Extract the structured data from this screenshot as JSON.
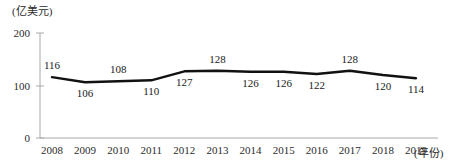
{
  "chart_data": {
    "type": "line",
    "title": "",
    "unit_label": "(亿美元)",
    "xlabel": "(年份)",
    "ylabel": "",
    "categories": [
      "2008",
      "2009",
      "2010",
      "2011",
      "2012",
      "2013",
      "2014",
      "2015",
      "2016",
      "2017",
      "2018",
      "2019"
    ],
    "values": [
      116,
      106,
      108,
      110,
      127,
      128,
      126,
      126,
      122,
      128,
      120,
      114
    ],
    "label_positions": [
      "above",
      "below",
      "above",
      "below",
      "below",
      "above",
      "below",
      "below",
      "below",
      "above",
      "below",
      "below"
    ],
    "ylim": [
      0,
      200
    ],
    "yticks": [
      0,
      100,
      200
    ],
    "ytick_labels": [
      "0",
      "100",
      "200"
    ],
    "grid": false,
    "legend": "none",
    "line_color": "#111111",
    "axis_color": "#a8a8a8"
  }
}
